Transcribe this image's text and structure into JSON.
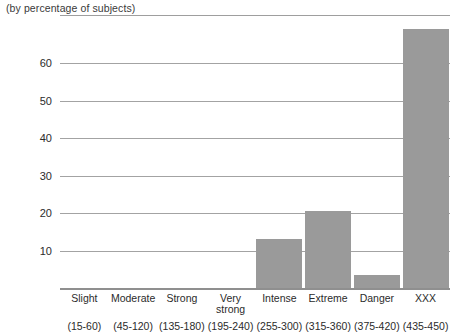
{
  "caption": "(by percentage of subjects)",
  "chart_data": {
    "type": "bar",
    "title": "",
    "subtitle": "(by percentage of subjects)",
    "xlabel": "",
    "ylabel": "",
    "ylim": [
      0,
      72
    ],
    "yticks": [
      10,
      20,
      30,
      40,
      50,
      60
    ],
    "grid": true,
    "legend": false,
    "bar_color": "#9a9a9a",
    "categories": [
      "Slight",
      "Moderate",
      "Strong",
      "Very\nstrong",
      "Intense",
      "Extreme",
      "Danger",
      "XXX"
    ],
    "category_ranges": [
      "(15-60)",
      "(45-120)",
      "(135-180)",
      "(195-240)",
      "(255-300)",
      "(315-360)",
      "(375-420)",
      "(435-450)"
    ],
    "values": [
      0,
      0,
      0,
      0,
      13,
      20.5,
      3.5,
      69
    ],
    "series": [
      {
        "name": "percentage of subjects",
        "values": [
          0,
          0,
          0,
          0,
          13,
          20.5,
          3.5,
          69
        ]
      }
    ]
  },
  "axis": {
    "y_tick_0": "10",
    "y_tick_1": "20",
    "y_tick_2": "30",
    "y_tick_3": "40",
    "y_tick_4": "50",
    "y_tick_5": "60"
  }
}
